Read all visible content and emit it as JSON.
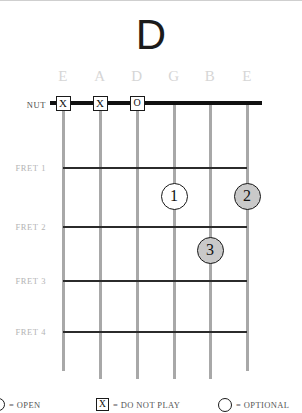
{
  "chord": {
    "title": "D",
    "instrument_strings": [
      "E",
      "A",
      "D",
      "G",
      "B",
      "E"
    ],
    "rows": [
      {
        "label": "NUT"
      },
      {
        "label": "FRET 1"
      },
      {
        "label": "FRET 2"
      },
      {
        "label": "FRET 3"
      },
      {
        "label": "FRET 4"
      }
    ],
    "nut_markers": [
      {
        "string": "E",
        "symbol": "X",
        "meaning": "do-not-play"
      },
      {
        "string": "A",
        "symbol": "X",
        "meaning": "do-not-play"
      },
      {
        "string": "D",
        "symbol": "O",
        "meaning": "open"
      }
    ],
    "finger_dots": [
      {
        "finger": "1",
        "string": "G",
        "fret": 2,
        "style": "open"
      },
      {
        "finger": "2",
        "string": "E",
        "fret": 2,
        "style": "shaded"
      },
      {
        "finger": "3",
        "string": "B",
        "fret": 3,
        "style": "shaded"
      }
    ]
  },
  "legend": {
    "open": {
      "symbol": "O",
      "text": "= OPEN"
    },
    "do_not_play": {
      "symbol": "X",
      "text": "= DO NOT PLAY"
    },
    "optional": {
      "symbol": "O",
      "text": "= OPTIONAL"
    }
  },
  "colors": {
    "ink": "#111111",
    "string": "#a8a8a8",
    "label_gray": "#b4b4b4",
    "string_label_gray": "#d6d6d6",
    "dot_shaded": "#c9c9c9"
  }
}
